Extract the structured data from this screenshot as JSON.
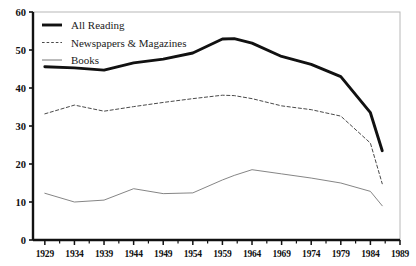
{
  "chart_data": {
    "type": "line",
    "title": "",
    "xlabel": "",
    "ylabel": "",
    "xlim": [
      1927,
      1989
    ],
    "ylim": [
      0,
      60
    ],
    "grid": false,
    "legend_position": "top-left",
    "x_ticks": [
      "1929",
      "1934",
      "1939",
      "1944",
      "1949",
      "1954",
      "1959",
      "1964",
      "1969",
      "1974",
      "1979",
      "1984",
      "1989"
    ],
    "y_ticks": [
      "0",
      "10",
      "20",
      "30",
      "40",
      "50",
      "60"
    ],
    "x": [
      1929,
      1934,
      1939,
      1944,
      1949,
      1954,
      1959,
      1961,
      1964,
      1969,
      1974,
      1979,
      1984,
      1986
    ],
    "series": [
      {
        "name": "All Reading",
        "style": "solid-thick",
        "color": "#111111",
        "values": [
          45.6,
          45.3,
          44.7,
          46.6,
          47.6,
          49.2,
          52.9,
          53.0,
          51.8,
          48.3,
          46.2,
          43.0,
          33.5,
          23.5
        ]
      },
      {
        "name": "Newspapers & Magazines",
        "style": "dashed",
        "color": "#4a4a4a",
        "values": [
          33.2,
          35.5,
          33.9,
          35.1,
          36.2,
          37.2,
          38.1,
          38.0,
          37.2,
          35.3,
          34.3,
          32.6,
          25.5,
          14.8
        ]
      },
      {
        "name": "Books",
        "style": "solid-thin",
        "color": "#777777",
        "values": [
          12.3,
          10.0,
          10.5,
          13.5,
          12.2,
          12.4,
          15.8,
          17.0,
          18.5,
          17.4,
          16.3,
          15.0,
          12.8,
          9.0
        ]
      }
    ]
  },
  "legend": {
    "entries": [
      {
        "label": "All Reading"
      },
      {
        "label": "Newspapers & Magazines"
      },
      {
        "label": "Books"
      }
    ]
  }
}
